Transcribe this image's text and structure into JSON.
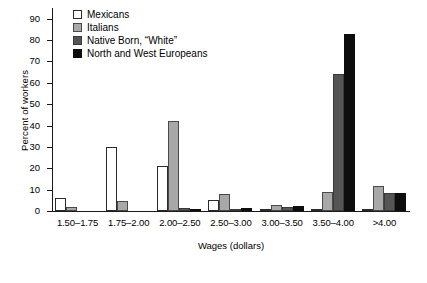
{
  "chart_data": {
    "type": "bar",
    "title": "",
    "xlabel": "Wages (dollars)",
    "ylabel": "Percent of workers",
    "ylim": [
      0,
      95
    ],
    "yticks": [
      0,
      10,
      20,
      30,
      40,
      50,
      60,
      70,
      80,
      90
    ],
    "grid": false,
    "legend_position": "top-left",
    "categories": [
      "1.50–1.75",
      "1.75–2.00",
      "2.00–2.50",
      "2.50–3.00",
      "3.00–3.50",
      "3.50–4.00",
      ">4.00"
    ],
    "series": [
      {
        "name": "Mexicans",
        "color": "#ffffff",
        "values": [
          6,
          30,
          21,
          5,
          0.5,
          0.5,
          0.3
        ]
      },
      {
        "name": "Italians",
        "color": "#a8a8a8",
        "values": [
          2,
          4.5,
          42,
          8,
          3,
          9,
          11.5
        ]
      },
      {
        "name": "Native Born, “White”",
        "color": "#555555",
        "values": [
          0,
          0,
          1.5,
          1,
          2,
          64,
          8.5
        ]
      },
      {
        "name": "North and West Europeans",
        "color": "#0d0d0d",
        "values": [
          0,
          0,
          0.5,
          1.5,
          2.5,
          83,
          8.5
        ]
      }
    ]
  }
}
